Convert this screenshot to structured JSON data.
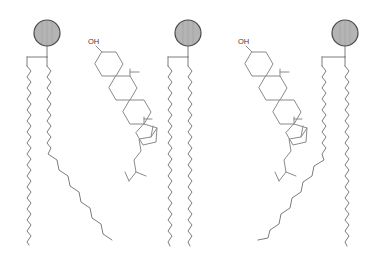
{
  "figure": {
    "background_color": "#ffffff",
    "width": 370,
    "height": 268
  },
  "palette": {
    "bond_stroke": "#6d6d6d",
    "ring_stroke": "#8a8a8a",
    "head_fill": "#b4b4b4",
    "head_stroke": "#4a4a4a",
    "label_color": "#3c3c3c"
  },
  "molecules": [
    {
      "id": "phospholipid-1",
      "type": "phospholipid",
      "head": {
        "name": "head-group",
        "shape": "circle",
        "cx": 47,
        "cy": 33,
        "r": 13
      },
      "stem": {
        "x": 47,
        "y_top": 46,
        "y_bottom": 57
      },
      "linker": {
        "y": 57,
        "x_left": 27,
        "x_right": 47
      },
      "tails": [
        {
          "id": "tail-1a",
          "label": "saturated-tail",
          "kinked": false,
          "x": 27,
          "y_start": 57,
          "y_end": 245,
          "amplitude": 4.2,
          "period": 11
        },
        {
          "id": "tail-1b",
          "label": "unsaturated-tail",
          "kinked": true,
          "x": 47,
          "y_start": 57,
          "kink_y": 152,
          "y_end": 240,
          "amplitude": 4.2,
          "period": 11
        }
      ]
    },
    {
      "id": "cholesterol-1",
      "type": "cholesterol",
      "hydroxyl_label": "OH",
      "label_x": 88,
      "label_y": 44,
      "origin_x": 86,
      "origin_y": 48
    },
    {
      "id": "phospholipid-2",
      "type": "phospholipid",
      "head": {
        "name": "head-group",
        "shape": "circle",
        "cx": 188,
        "cy": 33,
        "r": 13
      },
      "stem": {
        "x": 188,
        "y_top": 46,
        "y_bottom": 57
      },
      "linker": {
        "y": 57,
        "x_left": 168,
        "x_right": 188
      },
      "tails": [
        {
          "id": "tail-2a",
          "label": "saturated-tail",
          "kinked": false,
          "x": 168,
          "y_start": 57,
          "y_end": 245,
          "amplitude": 4.2,
          "period": 11
        },
        {
          "id": "tail-2b",
          "label": "saturated-tail",
          "kinked": false,
          "x": 188,
          "y_start": 57,
          "y_end": 245,
          "amplitude": 4.2,
          "period": 11
        }
      ]
    },
    {
      "id": "cholesterol-2",
      "type": "cholesterol",
      "hydroxyl_label": "OH",
      "label_x": 238,
      "label_y": 44,
      "origin_x": 236,
      "origin_y": 48
    },
    {
      "id": "phospholipid-3",
      "type": "phospholipid",
      "head": {
        "name": "head-group",
        "shape": "circle",
        "cx": 345,
        "cy": 33,
        "r": 13
      },
      "stem": {
        "x": 345,
        "y_top": 46,
        "y_bottom": 57
      },
      "linker": {
        "y": 57,
        "x_left": 322,
        "x_right": 345
      },
      "tails": [
        {
          "id": "tail-3a",
          "label": "unsaturated-tail",
          "kinked": true,
          "x": 322,
          "y_start": 57,
          "kink_y": 158,
          "y_end": 238,
          "amplitude": 4.2,
          "period": 11
        },
        {
          "id": "tail-3b",
          "label": "saturated-tail",
          "kinked": false,
          "x": 345,
          "y_start": 57,
          "y_end": 245,
          "amplitude": 4.2,
          "period": 11
        }
      ]
    }
  ],
  "labels": {
    "hydroxyl_1": "OH",
    "hydroxyl_2": "OH"
  }
}
